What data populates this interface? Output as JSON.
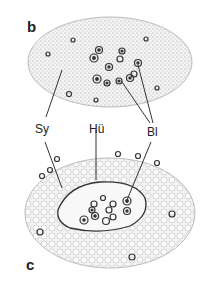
{
  "figure": {
    "panels": [
      {
        "id": "b",
        "label": "b"
      },
      {
        "id": "c",
        "label": "c"
      }
    ],
    "labels": {
      "sy": "Sy",
      "hu": "Hü",
      "bl": "Bl"
    },
    "colors": {
      "outline": "#333333",
      "stipple": "#b8b8b8",
      "background": "#ffffff"
    }
  }
}
